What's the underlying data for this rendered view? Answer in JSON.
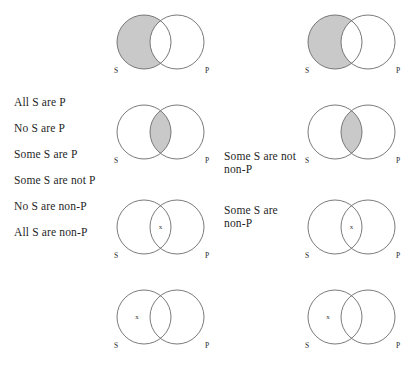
{
  "page": {
    "background_color": "#ffffff",
    "ink_color": "#4a4a4a",
    "shade_color": "#c9c9c9"
  },
  "left_propositions": [
    {
      "text": "All S are P"
    },
    {
      "text": "No S are P"
    },
    {
      "text": "Some S are P"
    },
    {
      "text": "Some S are not P"
    },
    {
      "text": "No S are non-P"
    },
    {
      "text": "All S are non-P"
    }
  ],
  "right_propositions": [
    {
      "text": "Some S are not\nnon-P"
    },
    {
      "text": "Some S are\nnon-P"
    }
  ],
  "diagram_labels": {
    "s": "S",
    "p": "P",
    "x": "x"
  },
  "diagrams": [
    {
      "name": "left-diagram-1",
      "column": "left",
      "row": 1,
      "shading": "s-only",
      "x_mark": "none"
    },
    {
      "name": "left-diagram-2",
      "column": "left",
      "row": 2,
      "shading": "overlap",
      "x_mark": "none"
    },
    {
      "name": "left-diagram-3",
      "column": "left",
      "row": 3,
      "shading": "none",
      "x_mark": "overlap"
    },
    {
      "name": "left-diagram-4",
      "column": "left",
      "row": 4,
      "shading": "none",
      "x_mark": "s-only"
    },
    {
      "name": "right-diagram-1",
      "column": "right",
      "row": 1,
      "shading": "s-only",
      "x_mark": "none"
    },
    {
      "name": "right-diagram-2",
      "column": "right",
      "row": 2,
      "shading": "overlap",
      "x_mark": "none"
    },
    {
      "name": "right-diagram-3",
      "column": "right",
      "row": 3,
      "shading": "none",
      "x_mark": "overlap"
    },
    {
      "name": "right-diagram-4",
      "column": "right",
      "row": 4,
      "shading": "none",
      "x_mark": "s-only"
    }
  ]
}
